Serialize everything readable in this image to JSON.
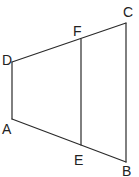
{
  "diagram": {
    "type": "geometry-figure",
    "stroke_color": "#2a2a2a",
    "points": {
      "A": {
        "label": "A",
        "x": 12,
        "y": 119
      },
      "B": {
        "label": "B",
        "x": 126,
        "y": 162
      },
      "C": {
        "label": "C",
        "x": 126,
        "y": 23
      },
      "D": {
        "label": "D",
        "x": 12,
        "y": 62
      },
      "E": {
        "label": "E",
        "x": 81,
        "y": 145
      },
      "F": {
        "label": "F",
        "x": 81,
        "y": 39
      }
    },
    "segments": [
      "DA",
      "AB",
      "BC",
      "CD",
      "EF"
    ],
    "labels": {
      "A": "A",
      "B": "B",
      "C": "C",
      "D": "D",
      "E": "E",
      "F": "F"
    }
  }
}
